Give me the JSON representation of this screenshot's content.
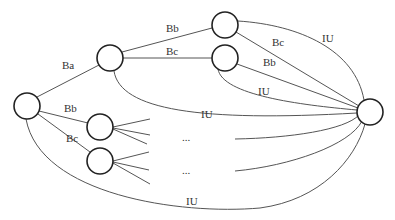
{
  "diagram": {
    "type": "tree-graph",
    "nodes": [
      {
        "id": "root",
        "cx": 27,
        "cy": 106,
        "r": 13
      },
      {
        "id": "a",
        "cx": 110,
        "cy": 58,
        "r": 13
      },
      {
        "id": "ab",
        "cx": 225,
        "cy": 25,
        "r": 13
      },
      {
        "id": "ac",
        "cx": 225,
        "cy": 58,
        "r": 13
      },
      {
        "id": "b",
        "cx": 100,
        "cy": 127,
        "r": 13
      },
      {
        "id": "c",
        "cx": 100,
        "cy": 161,
        "r": 13
      },
      {
        "id": "sink",
        "cx": 370,
        "cy": 112,
        "r": 13
      }
    ],
    "labels": {
      "root_a": "Ba",
      "a_ab": "Bb",
      "a_ac": "Bc",
      "ab_sink_bc": "Bc",
      "ab_sink_iu": "IU",
      "ac_sink_bb": "Bb",
      "ac_sink_iu": "IU",
      "a_sink_iu": "IU",
      "root_b": "Bb",
      "root_c": "Bc",
      "b_ellipsis": "...",
      "c_ellipsis": "...",
      "root_sink_iu": "IU"
    }
  }
}
